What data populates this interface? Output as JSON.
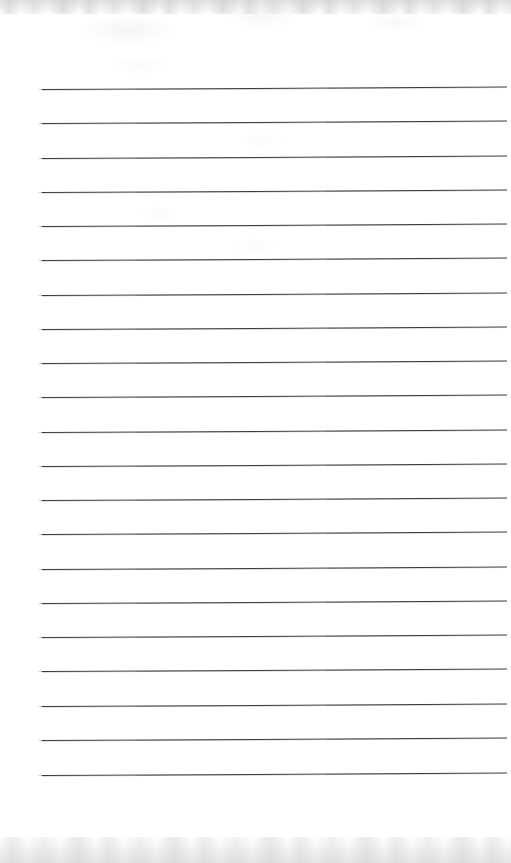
{
  "document": {
    "kind": "lined-notebook-paper",
    "title": "Blank ruled notebook page",
    "page_width": 511,
    "page_height": 863,
    "background_color": "#ffffff",
    "rule_color": "#3b3b3d",
    "rule_count": 21,
    "rule_left_x": 42,
    "rule_right_x": 507,
    "rule_thickness": 1.15,
    "first_rule_y": 89,
    "rule_spacing": 34.3,
    "rule_tilt_degrees": -0.3,
    "top_margin": 89,
    "bottom_margin": 88,
    "written_text": "",
    "rules": [
      {
        "index": 1,
        "y": 89
      },
      {
        "index": 2,
        "y": 123
      },
      {
        "index": 3,
        "y": 158
      },
      {
        "index": 4,
        "y": 192
      },
      {
        "index": 5,
        "y": 226
      },
      {
        "index": 6,
        "y": 260
      },
      {
        "index": 7,
        "y": 295
      },
      {
        "index": 8,
        "y": 329
      },
      {
        "index": 9,
        "y": 363
      },
      {
        "index": 10,
        "y": 397
      },
      {
        "index": 11,
        "y": 432
      },
      {
        "index": 12,
        "y": 466
      },
      {
        "index": 13,
        "y": 500
      },
      {
        "index": 14,
        "y": 534
      },
      {
        "index": 15,
        "y": 569
      },
      {
        "index": 16,
        "y": 603
      },
      {
        "index": 17,
        "y": 637
      },
      {
        "index": 18,
        "y": 671
      },
      {
        "index": 19,
        "y": 706
      },
      {
        "index": 20,
        "y": 740
      },
      {
        "index": 21,
        "y": 775
      }
    ]
  }
}
